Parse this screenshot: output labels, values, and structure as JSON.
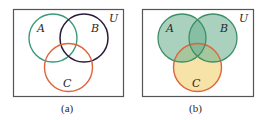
{
  "panels": [
    {
      "caption": "(a)",
      "universe_label": "U",
      "sets": [
        {
          "label": "A",
          "stroke": "#3a9a78",
          "fill": "none"
        },
        {
          "label": "B",
          "stroke": "#2b1a3a",
          "fill": "none"
        },
        {
          "label": "C",
          "stroke": "#e0643a",
          "fill": "none"
        }
      ]
    },
    {
      "caption": "(b)",
      "universe_label": "U",
      "sets": [
        {
          "label": "A",
          "stroke": "#3d8f6a",
          "fill": "#8cc2a8"
        },
        {
          "label": "B",
          "stroke": "#3d8f6a",
          "fill": "#8cc2a8"
        },
        {
          "label": "C",
          "stroke": "#e0643a",
          "fill": "#f7e3a8"
        }
      ]
    }
  ],
  "colors": {
    "box_stroke": "#555555",
    "text": "#2a2a2a"
  }
}
